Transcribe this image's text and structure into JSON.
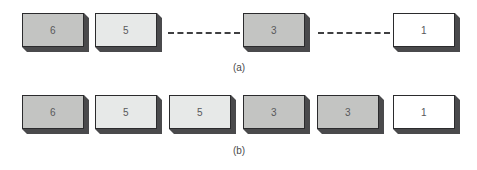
{
  "figure": {
    "background": "#ffffff",
    "block_fill_mid": "#c3c4c2",
    "block_fill_light": "#e7e9e8",
    "block_fill_white": "#ffffff",
    "block_shadow": "#3a3a3c",
    "block_outline": "#2b2b2d",
    "label_color": "#58585a",
    "dash_color": "#3f3f41"
  },
  "chart_data": {
    "type": "diagram",
    "title": "",
    "panels": [
      {
        "caption": "(a)",
        "blocks": [
          {
            "label": "6",
            "shade": "mid",
            "x": 22,
            "y": 13
          },
          {
            "label": "5",
            "shade": "light",
            "x": 95,
            "y": 13
          },
          {
            "label": "3",
            "shade": "mid",
            "x": 243,
            "y": 13
          },
          {
            "label": "1",
            "shade": "white",
            "x": 393,
            "y": 13
          }
        ],
        "connectors": [
          {
            "x": 168,
            "y": 32,
            "width": 72
          },
          {
            "x": 318,
            "y": 32,
            "width": 72
          }
        ]
      },
      {
        "caption": "(b)",
        "blocks": [
          {
            "label": "6",
            "shade": "mid",
            "x": 22,
            "y": 13
          },
          {
            "label": "5",
            "shade": "light",
            "x": 95,
            "y": 13
          },
          {
            "label": "5",
            "shade": "light",
            "x": 169,
            "y": 13
          },
          {
            "label": "3",
            "shade": "mid",
            "x": 243,
            "y": 13
          },
          {
            "label": "3",
            "shade": "mid",
            "x": 317,
            "y": 13
          },
          {
            "label": "1",
            "shade": "white",
            "x": 393,
            "y": 13
          }
        ],
        "connectors": []
      }
    ]
  },
  "panel_a": {
    "caption": "(a)",
    "caption_x": 219,
    "caption_y": 62,
    "blocks": [
      {
        "label": "6",
        "shade": "mid",
        "x": 22,
        "y": 13
      },
      {
        "label": "5",
        "shade": "light",
        "x": 95,
        "y": 13
      },
      {
        "label": "3",
        "shade": "mid",
        "x": 243,
        "y": 13
      },
      {
        "label": "1",
        "shade": "white",
        "x": 393,
        "y": 13
      }
    ],
    "connectors": [
      {
        "x": 168,
        "y": 32,
        "width": 72
      },
      {
        "x": 318,
        "y": 32,
        "width": 72
      }
    ]
  },
  "panel_b": {
    "caption": "(b)",
    "caption_x": 219,
    "caption_y": 63,
    "blocks": [
      {
        "label": "6",
        "shade": "mid",
        "x": 22,
        "y": 13
      },
      {
        "label": "5",
        "shade": "light",
        "x": 95,
        "y": 13
      },
      {
        "label": "5",
        "shade": "light",
        "x": 169,
        "y": 13
      },
      {
        "label": "3",
        "shade": "mid",
        "x": 243,
        "y": 13
      },
      {
        "label": "3",
        "shade": "mid",
        "x": 317,
        "y": 13
      },
      {
        "label": "1",
        "shade": "white",
        "x": 393,
        "y": 13
      }
    ],
    "connectors": []
  }
}
